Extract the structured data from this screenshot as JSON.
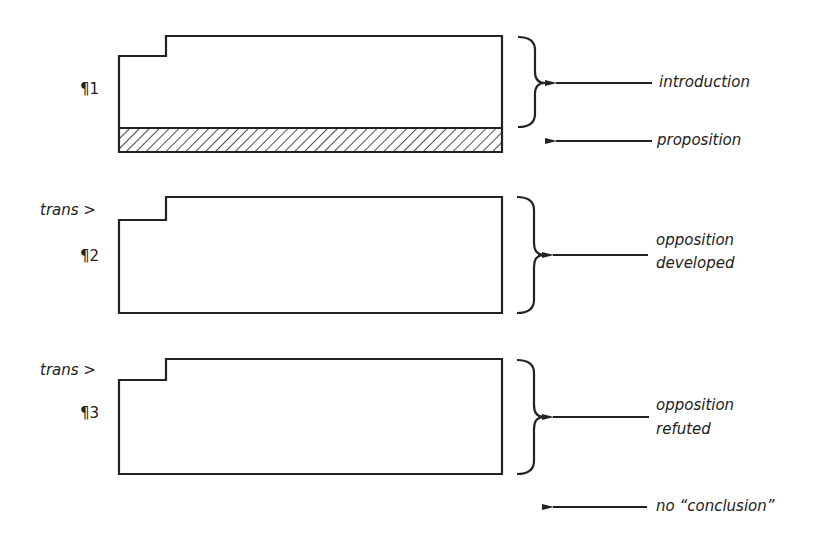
{
  "diagram": {
    "colors": {
      "ink": "#222222",
      "background": "#ffffff"
    },
    "paragraphs": [
      {
        "label": "¶1",
        "transition": null,
        "annotations": [
          "introduction",
          "proposition"
        ],
        "hatched_band": true
      },
      {
        "label": "¶2",
        "transition": "trans >",
        "annotations": [
          "opposition developed"
        ],
        "hatched_band": false
      },
      {
        "label": "¶3",
        "transition": "trans >",
        "annotations": [
          "opposition refuted"
        ],
        "hatched_band": false
      }
    ],
    "labels": {
      "p1": "¶1",
      "p2": "¶2",
      "p3": "¶3",
      "trans2": "trans >",
      "trans3": "trans >",
      "introduction": "introduction",
      "proposition": "proposition",
      "opposition_developed_line1": "opposition",
      "opposition_developed_line2": "developed",
      "opposition_refuted_line1": "opposition",
      "opposition_refuted_line2": "refuted",
      "no_conclusion": "no “conclusion”"
    }
  }
}
